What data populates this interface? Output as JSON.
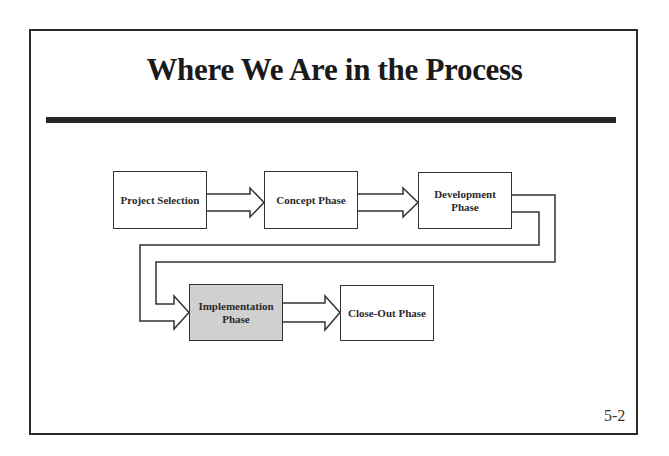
{
  "slide": {
    "title": "Where We Are in the Process",
    "page_number": "5-2"
  },
  "process": {
    "steps": [
      {
        "label": "Project Selection",
        "active": false
      },
      {
        "label": "Concept Phase",
        "active": false
      },
      {
        "label": "Development Phase",
        "active": false
      },
      {
        "label": "Implementation Phase",
        "active": true
      },
      {
        "label": "Close-Out Phase",
        "active": false
      }
    ],
    "active_color": "#d0d0d0"
  }
}
